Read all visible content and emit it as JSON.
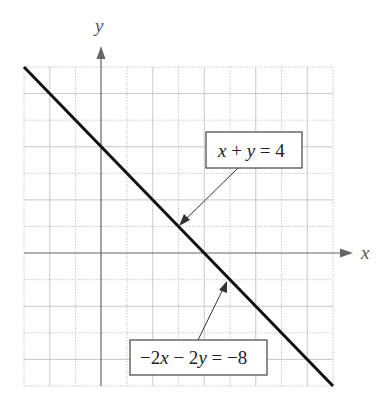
{
  "chart_data": {
    "type": "line",
    "title": "",
    "xlabel": "x",
    "ylabel": "y",
    "xlim": [
      -3,
      9
    ],
    "ylim": [
      -5,
      7
    ],
    "grid": true,
    "grid_step": 1,
    "tick_labels_shown": false,
    "series": [
      {
        "name": "x + y = 4",
        "equivalent": "-2x - 2y = -8",
        "points": [
          [
            -3,
            7
          ],
          [
            9,
            -5
          ]
        ],
        "color": "#111111"
      }
    ],
    "annotations": [
      {
        "text": "x + y = 4",
        "arrow_to": [
          3,
          1
        ]
      },
      {
        "text": "-2x - 2y = -8",
        "arrow_to": [
          5,
          -1
        ]
      }
    ]
  },
  "labels": {
    "x_axis": "x",
    "y_axis": "y",
    "eq1": {
      "a": "x",
      "op1": " + ",
      "b": "y",
      "rest": " = 4"
    },
    "eq2": {
      "p1": "−2",
      "a": "x",
      "op": " − 2",
      "b": "y",
      "rest": " = −8"
    }
  },
  "colors": {
    "line": "#111111",
    "axis": "#555555",
    "grid": "#c8c8c8",
    "box_border": "#444444"
  }
}
